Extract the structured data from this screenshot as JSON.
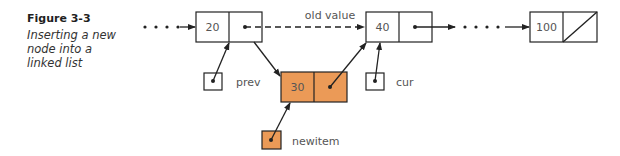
{
  "figure": {
    "number": "Figure 3-3",
    "title": "Inserting a new node into a linked list"
  },
  "nodes": [
    {
      "id": "node-20",
      "value": "20",
      "highlight": false
    },
    {
      "id": "node-40",
      "value": "40",
      "highlight": false
    },
    {
      "id": "node-100",
      "value": "100",
      "highlight": false,
      "next": "null"
    },
    {
      "id": "node-30",
      "value": "30",
      "highlight": true
    }
  ],
  "pointers": [
    {
      "name": "prev",
      "label": "prev",
      "points_to": "node-20"
    },
    {
      "name": "cur",
      "label": "cur",
      "points_to": "node-40"
    },
    {
      "name": "newitem",
      "label": "newitem",
      "points_to": "node-30",
      "highlight": true
    }
  ],
  "annotations": {
    "old_link_label": "old value"
  },
  "colors": {
    "highlight_fill": "#eb9a57",
    "stroke": "#222222",
    "text": "#555555"
  }
}
